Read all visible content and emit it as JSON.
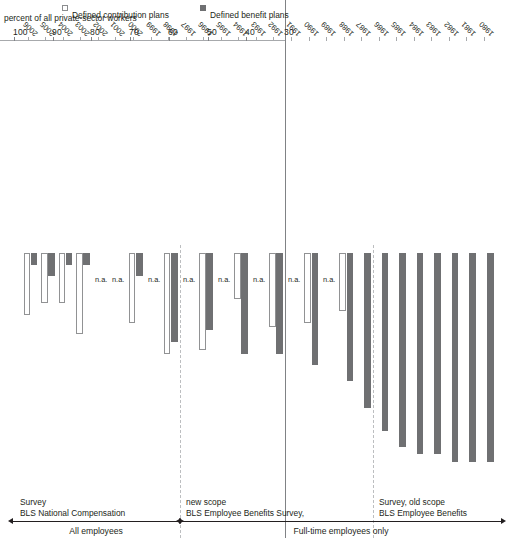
{
  "chart_data": {
    "type": "bar",
    "title": "",
    "ylabel": "percent of all private-sector workers",
    "xlabel": "",
    "orientation": "horizontal-rotated",
    "ylim": [
      30,
      100
    ],
    "yticks": [
      100,
      90,
      80,
      70,
      60,
      50,
      40,
      30
    ],
    "grid": false,
    "legend_position": "bottom-right",
    "categories": [
      "1980",
      "1981",
      "1982",
      "1983",
      "1984",
      "1985",
      "1986",
      "1987",
      "1988",
      "1989",
      "1990",
      "1991",
      "1992",
      "1993",
      "1994",
      "1995",
      "1996",
      "1997",
      "1998",
      "1999",
      "2000",
      "2001",
      "2002",
      "2003",
      "2004",
      "2005",
      "2006"
    ],
    "series": [
      {
        "name": "Defined benefit plans",
        "color": "#6f7072",
        "values": [
          84,
          84,
          84,
          82,
          82,
          80,
          76,
          70,
          63,
          null,
          59,
          null,
          56,
          null,
          56,
          null,
          50,
          null,
          53,
          null,
          36,
          null,
          null,
          33,
          33,
          36,
          33
        ]
      },
      {
        "name": "Defined contribution plans",
        "color": "#ffffff",
        "values": [
          null,
          null,
          null,
          null,
          null,
          null,
          null,
          null,
          45,
          null,
          48,
          null,
          49,
          null,
          42,
          null,
          55,
          null,
          56,
          null,
          48,
          null,
          null,
          51,
          43,
          43,
          46
        ]
      }
    ],
    "missing_label": "n.a.",
    "missing_years": [
      "1989",
      "1991",
      "1993",
      "1995",
      "1997",
      "1999",
      "2001",
      "2002"
    ],
    "annotations": {
      "era_top": {
        "label": "All employees",
        "source": "BLS National Compensation Survey",
        "range": "1999-2006"
      },
      "era_bottom": {
        "label": "Full-time employees only",
        "sources": [
          "BLS Employee Benefits Survey, new scope",
          "BLS Employee Benefits Survey, old scope"
        ],
        "range": "1980-1998"
      }
    }
  },
  "axis": {
    "ylabel": "percent of all private-sector workers",
    "ticks": [
      {
        "value": 100,
        "label": "100"
      },
      {
        "value": 90,
        "label": "90"
      },
      {
        "value": 80,
        "label": "80"
      },
      {
        "value": 70,
        "label": "70"
      },
      {
        "value": 60,
        "label": "60"
      },
      {
        "value": 50,
        "label": "50"
      },
      {
        "value": 40,
        "label": "40"
      },
      {
        "value": 30,
        "label": "30"
      }
    ]
  },
  "eras": {
    "all_employees": {
      "bracket_label": "All employees",
      "survey_label_line1": "BLS National Compensation",
      "survey_label_line2": "Survey"
    },
    "full_time": {
      "bracket_label": "Full-time employees only",
      "new_scope_line1": "BLS Employee Benefits Survey,",
      "new_scope_line2": "new scope",
      "old_scope_line1": "BLS Employee Benefits",
      "old_scope_line2": "Survey, old scope"
    }
  },
  "legend": {
    "items": [
      {
        "key": "db",
        "label": "Defined benefit plans",
        "swatch": "#6f7072"
      },
      {
        "key": "dc",
        "label": "Defined contribution plans",
        "swatch": "#ffffff"
      }
    ]
  },
  "years": [
    "1980",
    "1981",
    "1982",
    "1983",
    "1984",
    "1985",
    "1986",
    "1987",
    "1988",
    "1989",
    "1990",
    "1991",
    "1992",
    "1993",
    "1994",
    "1995",
    "1996",
    "1997",
    "1998",
    "1999",
    "2000",
    "2001",
    "2002",
    "2003",
    "2004",
    "2005",
    "2006"
  ],
  "na_text": "n.a."
}
